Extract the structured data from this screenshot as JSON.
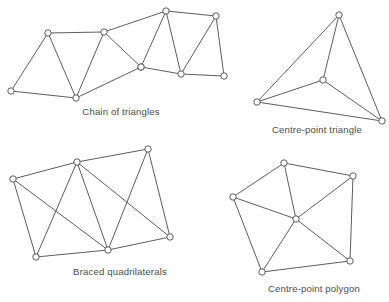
{
  "page": {
    "width": 389,
    "height": 302,
    "background_color": "#ffffff",
    "line_color": "#4a4a4a",
    "node_fill_color": "#ffffff",
    "caption_color": "#4d4d4d"
  },
  "chart_data": {
    "type": "diagram",
    "subtitle": "",
    "xlabel": "",
    "ylabel": "",
    "grid": false,
    "legend": false,
    "figure_count": 4,
    "figures": [
      {
        "id": "chain-of-triangles",
        "caption": "Chain of triangles",
        "caption_position": {
          "x": 121,
          "y": 115
        },
        "node_radius": 3.2,
        "node_count": 10,
        "edge_count": 17,
        "nodes": [
          {
            "id": "n0",
            "label": "A",
            "x": 11,
            "y": 91
          },
          {
            "id": "n1",
            "label": "B",
            "x": 48,
            "y": 33
          },
          {
            "id": "n2",
            "label": "C",
            "x": 76,
            "y": 98
          },
          {
            "id": "n3",
            "label": "D",
            "x": 104,
            "y": 32
          },
          {
            "id": "n4",
            "label": "E",
            "x": 141,
            "y": 67
          },
          {
            "id": "n5",
            "label": "F",
            "x": 166,
            "y": 11
          },
          {
            "id": "n6",
            "label": "G",
            "x": 181,
            "y": 74
          },
          {
            "id": "n7",
            "label": "H",
            "x": 216,
            "y": 16
          },
          {
            "id": "n8",
            "label": "I",
            "x": 224,
            "y": 76
          },
          {
            "id": "n9",
            "label": "J",
            "x": 141,
            "y": 67
          }
        ],
        "edges": [
          [
            "n0",
            "n1"
          ],
          [
            "n0",
            "n2"
          ],
          [
            "n1",
            "n2"
          ],
          [
            "n1",
            "n3"
          ],
          [
            "n2",
            "n3"
          ],
          [
            "n2",
            "n4"
          ],
          [
            "n3",
            "n4"
          ],
          [
            "n3",
            "n5"
          ],
          [
            "n4",
            "n5"
          ],
          [
            "n4",
            "n6"
          ],
          [
            "n5",
            "n6"
          ],
          [
            "n5",
            "n7"
          ],
          [
            "n6",
            "n7"
          ],
          [
            "n6",
            "n8"
          ],
          [
            "n7",
            "n8"
          ]
        ]
      },
      {
        "id": "centre-point-triangle",
        "caption": "Centre-point triangle",
        "caption_position": {
          "x": 317,
          "y": 133
        },
        "node_radius": 3.2,
        "node_count": 4,
        "edge_count": 6,
        "nodes": [
          {
            "id": "t0",
            "label": "apex",
            "x": 339,
            "y": 15
          },
          {
            "id": "t1",
            "label": "left",
            "x": 257,
            "y": 102
          },
          {
            "id": "t2",
            "label": "right",
            "x": 382,
            "y": 121
          },
          {
            "id": "t3",
            "label": "centre",
            "x": 323,
            "y": 80
          }
        ],
        "edges": [
          [
            "t0",
            "t1"
          ],
          [
            "t1",
            "t2"
          ],
          [
            "t2",
            "t0"
          ],
          [
            "t3",
            "t0"
          ],
          [
            "t3",
            "t1"
          ],
          [
            "t3",
            "t2"
          ]
        ]
      },
      {
        "id": "braced-quadrilaterals",
        "caption": "Braced quadrilaterals",
        "caption_position": {
          "x": 120,
          "y": 275
        },
        "node_radius": 3.2,
        "node_count": 6,
        "edge_count": 11,
        "nodes": [
          {
            "id": "q0",
            "label": "top-left",
            "x": 13,
            "y": 179
          },
          {
            "id": "q1",
            "label": "top-mid",
            "x": 77,
            "y": 162
          },
          {
            "id": "q2",
            "label": "top-right",
            "x": 148,
            "y": 149
          },
          {
            "id": "q3",
            "label": "bottom-left",
            "x": 36,
            "y": 257
          },
          {
            "id": "q4",
            "label": "bottom-mid",
            "x": 108,
            "y": 250
          },
          {
            "id": "q5",
            "label": "bottom-right",
            "x": 170,
            "y": 237
          }
        ],
        "edges": [
          [
            "q0",
            "q1"
          ],
          [
            "q1",
            "q2"
          ],
          [
            "q0",
            "q3"
          ],
          [
            "q3",
            "q4"
          ],
          [
            "q4",
            "q5"
          ],
          [
            "q2",
            "q5"
          ],
          [
            "q1",
            "q3"
          ],
          [
            "q0",
            "q4"
          ],
          [
            "q1",
            "q4"
          ],
          [
            "q2",
            "q4"
          ],
          [
            "q1",
            "q5"
          ]
        ]
      },
      {
        "id": "centre-point-polygon",
        "caption": "Centre-point polygon",
        "caption_position": {
          "x": 314,
          "y": 292
        },
        "node_radius": 3.2,
        "node_count": 6,
        "edge_count": 10,
        "nodes": [
          {
            "id": "p0",
            "label": "top",
            "x": 284,
            "y": 163
          },
          {
            "id": "p1",
            "label": "top-right",
            "x": 353,
            "y": 176
          },
          {
            "id": "p2",
            "label": "left",
            "x": 233,
            "y": 197
          },
          {
            "id": "p3",
            "label": "bottom-right",
            "x": 350,
            "y": 261
          },
          {
            "id": "p4",
            "label": "bottom-left",
            "x": 262,
            "y": 272
          },
          {
            "id": "p5",
            "label": "centre",
            "x": 296,
            "y": 219
          }
        ],
        "edges": [
          [
            "p0",
            "p1"
          ],
          [
            "p1",
            "p3"
          ],
          [
            "p3",
            "p4"
          ],
          [
            "p4",
            "p2"
          ],
          [
            "p2",
            "p0"
          ],
          [
            "p5",
            "p0"
          ],
          [
            "p5",
            "p1"
          ],
          [
            "p5",
            "p2"
          ],
          [
            "p5",
            "p3"
          ],
          [
            "p5",
            "p4"
          ]
        ]
      }
    ]
  }
}
